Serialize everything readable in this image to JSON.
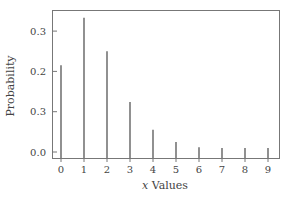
{
  "chart_data": {
    "type": "bar",
    "style": "stem",
    "title": "",
    "xlabel_prefix": "x",
    "xlabel_suffix": " Values",
    "xlabel": "x Values",
    "ylabel": "Probability",
    "categories": [
      "0",
      "1",
      "2",
      "3",
      "4",
      "5",
      "6",
      "7",
      "8",
      "9"
    ],
    "x": [
      0,
      1,
      2,
      3,
      4,
      5,
      6,
      7,
      8,
      9
    ],
    "values": [
      0.215,
      0.333,
      0.25,
      0.124,
      0.055,
      0.025,
      0.012,
      0.01,
      0.01,
      0.01
    ],
    "yticks": [
      0.0,
      0.1,
      0.2,
      0.3
    ],
    "ytick_labels": [
      "0.0",
      "0.3",
      "0.2",
      "0.3"
    ],
    "ylim": [
      -0.015,
      0.35
    ],
    "xlim": [
      -0.4,
      9.5
    ],
    "grid": false,
    "legend": null
  },
  "colors": {
    "stem": "#555555",
    "frame": "#777777",
    "text": "#444444"
  }
}
